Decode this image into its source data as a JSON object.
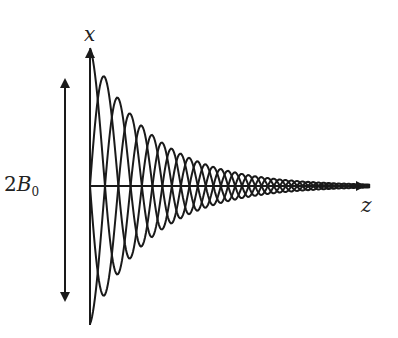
{
  "diagram": {
    "axes": {
      "vertical_label": "x",
      "horizontal_label": "z"
    },
    "amplitude_label": {
      "prefix": "2",
      "symbol": "B",
      "subscript": "0"
    },
    "colors": {
      "stroke": "#1a1a1a",
      "background": "#ffffff"
    }
  }
}
